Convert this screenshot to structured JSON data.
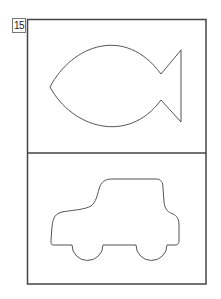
{
  "page": {
    "number": "15"
  },
  "panels": [
    {
      "id": "top",
      "shape": "fish",
      "label": "fish-outline"
    },
    {
      "id": "bottom",
      "shape": "car",
      "label": "car-outline"
    }
  ],
  "colors": {
    "stroke": "#444444",
    "background": "#ffffff",
    "label_border": "#777777"
  }
}
